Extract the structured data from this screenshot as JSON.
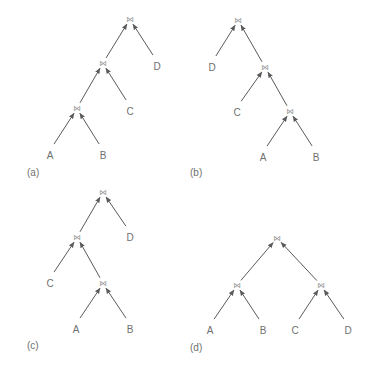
{
  "join_symbol": "⋈",
  "colors": {
    "text": "#6f6f6f",
    "edge": "#5a5a5a",
    "join": "#9a9a9a",
    "background": "#ffffff"
  },
  "panels": [
    {
      "caption": "(a)",
      "shape": "left-deep",
      "caption_pos": [
        27,
        176
      ],
      "nodes": [
        {
          "id": "j1",
          "label": "⋈",
          "x": 130,
          "y": 19,
          "type": "join"
        },
        {
          "id": "j2",
          "label": "⋈",
          "x": 103,
          "y": 63,
          "type": "join"
        },
        {
          "id": "j3",
          "label": "⋈",
          "x": 77,
          "y": 108,
          "type": "join"
        },
        {
          "id": "A",
          "label": "A",
          "x": 50,
          "y": 155,
          "type": "relation"
        },
        {
          "id": "B",
          "label": "B",
          "x": 103,
          "y": 155,
          "type": "relation"
        },
        {
          "id": "C",
          "label": "C",
          "x": 130,
          "y": 111,
          "type": "relation"
        },
        {
          "id": "D",
          "label": "D",
          "x": 157,
          "y": 66,
          "type": "relation"
        }
      ],
      "edges": [
        [
          "j2",
          "j1"
        ],
        [
          "D",
          "j1"
        ],
        [
          "j3",
          "j2"
        ],
        [
          "C",
          "j2"
        ],
        [
          "A",
          "j3"
        ],
        [
          "B",
          "j3"
        ]
      ]
    },
    {
      "caption": "(b)",
      "shape": "right-deep",
      "caption_pos": [
        190,
        176
      ],
      "nodes": [
        {
          "id": "j1",
          "label": "⋈",
          "x": 238,
          "y": 20,
          "type": "join"
        },
        {
          "id": "D",
          "label": "D",
          "x": 212,
          "y": 67,
          "type": "relation"
        },
        {
          "id": "j2",
          "label": "⋈",
          "x": 265,
          "y": 67,
          "type": "join"
        },
        {
          "id": "C",
          "label": "C",
          "x": 237,
          "y": 112,
          "type": "relation"
        },
        {
          "id": "j3",
          "label": "⋈",
          "x": 290,
          "y": 111,
          "type": "join"
        },
        {
          "id": "A",
          "label": "A",
          "x": 263,
          "y": 157,
          "type": "relation"
        },
        {
          "id": "B",
          "label": "B",
          "x": 316,
          "y": 157,
          "type": "relation"
        }
      ],
      "edges": [
        [
          "D",
          "j1"
        ],
        [
          "j2",
          "j1"
        ],
        [
          "C",
          "j2"
        ],
        [
          "j3",
          "j2"
        ],
        [
          "A",
          "j3"
        ],
        [
          "B",
          "j3"
        ]
      ]
    },
    {
      "caption": "(c)",
      "shape": "zig-zag",
      "caption_pos": [
        27,
        349
      ],
      "nodes": [
        {
          "id": "j1",
          "label": "⋈",
          "x": 103,
          "y": 192,
          "type": "join"
        },
        {
          "id": "j2",
          "label": "⋈",
          "x": 77,
          "y": 237,
          "type": "join"
        },
        {
          "id": "D",
          "label": "D",
          "x": 130,
          "y": 237,
          "type": "relation"
        },
        {
          "id": "C",
          "label": "C",
          "x": 50,
          "y": 283,
          "type": "relation"
        },
        {
          "id": "j3",
          "label": "⋈",
          "x": 103,
          "y": 283,
          "type": "join"
        },
        {
          "id": "A",
          "label": "A",
          "x": 76,
          "y": 329,
          "type": "relation"
        },
        {
          "id": "B",
          "label": "B",
          "x": 130,
          "y": 329,
          "type": "relation"
        }
      ],
      "edges": [
        [
          "j2",
          "j1"
        ],
        [
          "D",
          "j1"
        ],
        [
          "C",
          "j2"
        ],
        [
          "j3",
          "j2"
        ],
        [
          "A",
          "j3"
        ],
        [
          "B",
          "j3"
        ]
      ]
    },
    {
      "caption": "(d)",
      "shape": "bushy",
      "caption_pos": [
        190,
        351
      ],
      "nodes": [
        {
          "id": "j1",
          "label": "⋈",
          "x": 277,
          "y": 238,
          "type": "join"
        },
        {
          "id": "j2",
          "label": "⋈",
          "x": 237,
          "y": 285,
          "type": "join"
        },
        {
          "id": "j3",
          "label": "⋈",
          "x": 321,
          "y": 285,
          "type": "join"
        },
        {
          "id": "A",
          "label": "A",
          "x": 210,
          "y": 330,
          "type": "relation"
        },
        {
          "id": "B",
          "label": "B",
          "x": 263,
          "y": 330,
          "type": "relation"
        },
        {
          "id": "C",
          "label": "C",
          "x": 295,
          "y": 330,
          "type": "relation"
        },
        {
          "id": "D",
          "label": "D",
          "x": 348,
          "y": 330,
          "type": "relation"
        }
      ],
      "edges": [
        [
          "j2",
          "j1"
        ],
        [
          "j3",
          "j1"
        ],
        [
          "A",
          "j2"
        ],
        [
          "B",
          "j2"
        ],
        [
          "C",
          "j3"
        ],
        [
          "D",
          "j3"
        ]
      ]
    }
  ]
}
